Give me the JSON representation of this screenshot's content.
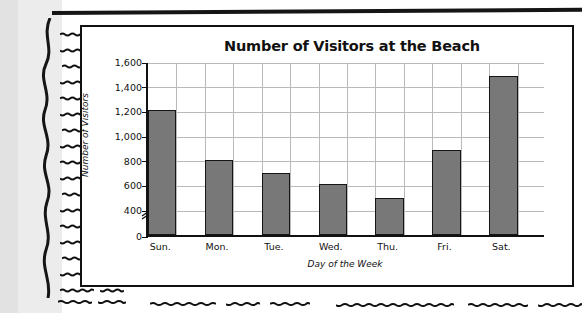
{
  "page": {
    "background_color": "#ffffff",
    "gutter_color": "#ececed",
    "rule_color": "#151515"
  },
  "chart_data": {
    "type": "bar",
    "title": "Number of Visitors at the Beach",
    "xlabel": "Day of the Week",
    "ylabel": "Number of Visitors",
    "categories": [
      "Sun.",
      "Mon.",
      "Tue.",
      "Wed.",
      "Thu.",
      "Fri.",
      "Sat."
    ],
    "values": [
      1200,
      800,
      690,
      600,
      490,
      880,
      1480
    ],
    "ylim": [
      0,
      1600
    ],
    "y_ticks": [
      0,
      400,
      600,
      800,
      1000,
      1200,
      1400,
      1600
    ],
    "y_tick_labels": [
      "0",
      "400",
      "600",
      "800",
      "1,000",
      "1,200",
      "1,400",
      "1,600"
    ],
    "axis_break": {
      "present": true,
      "between": [
        0,
        400
      ],
      "symbol": "double-slash"
    },
    "grid": true,
    "legend": false,
    "bar_color": "#787878",
    "bar_edge_color": "#151515",
    "grid_color": "#b9b9b9",
    "axis_color": "#111111"
  }
}
